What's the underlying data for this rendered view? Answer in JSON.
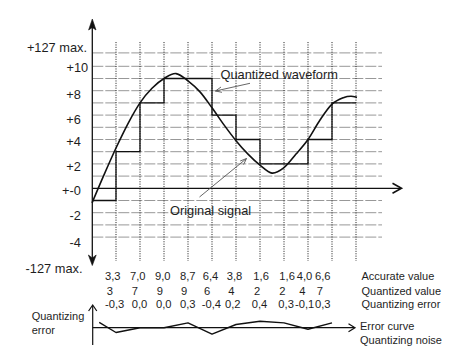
{
  "chart_data": {
    "type": "line",
    "title": "",
    "subtitle": "",
    "xlabel": "",
    "ylabel": "",
    "legend": "none (inline annotations)",
    "ylim": [
      -6.5,
      13.9
    ],
    "grid": {
      "horizontal": true,
      "horizontal_lines": [
        11.1,
        10,
        9,
        8,
        7,
        6,
        5,
        4,
        3,
        2,
        1,
        0,
        -1,
        -2,
        -3,
        -4
      ],
      "vertical_dotted_lines_at_samples": [
        1,
        2,
        3,
        4,
        5,
        6,
        7,
        8,
        9,
        10,
        11
      ]
    },
    "y_ticks": [
      {
        "label": "+127 max.",
        "value": 11.1
      },
      {
        "label": "+10",
        "value": 10
      },
      {
        "label": "+8",
        "value": 8
      },
      {
        "label": "+6",
        "value": 6
      },
      {
        "label": "+4",
        "value": 4
      },
      {
        "label": "+2",
        "value": 2
      },
      {
        "label": "+-0",
        "value": 0
      },
      {
        "label": "-2",
        "value": -2
      },
      {
        "label": "-4",
        "value": -4
      },
      {
        "label": "-127 max.",
        "value": -6.5
      }
    ],
    "x": [
      1,
      2,
      3,
      4,
      5,
      6,
      7,
      8,
      9,
      10
    ],
    "series": [
      {
        "name": "Original signal",
        "style": "smooth",
        "sample_values": [
          3.3,
          7.0,
          9.0,
          8.7,
          6.4,
          3.8,
          1.6,
          1.6,
          4.0,
          6.6
        ],
        "trace": [
          [
            0,
            -1.2
          ],
          [
            0.5,
            1.1
          ],
          [
            1,
            3.3
          ],
          [
            1.5,
            5.3
          ],
          [
            2,
            7.0
          ],
          [
            2.5,
            8.2
          ],
          [
            3,
            9.0
          ],
          [
            3.5,
            9.4
          ],
          [
            4,
            8.8
          ],
          [
            4.5,
            7.9
          ],
          [
            5,
            6.6
          ],
          [
            5.5,
            5.2
          ],
          [
            6,
            3.9
          ],
          [
            6.5,
            2.8
          ],
          [
            7,
            1.9
          ],
          [
            7.5,
            1.25
          ],
          [
            8,
            1.7
          ],
          [
            8.5,
            2.8
          ],
          [
            9,
            4.0
          ],
          [
            9.5,
            5.6
          ],
          [
            10,
            6.9
          ],
          [
            10.5,
            7.45
          ],
          [
            10.8,
            7.55
          ],
          [
            11.04,
            7.45
          ]
        ]
      },
      {
        "name": "Quantized waveform",
        "style": "step",
        "initial_value": -1,
        "values": [
          3,
          7,
          9,
          9,
          6,
          4,
          2,
          2,
          4,
          7
        ],
        "end_sample": 11
      }
    ],
    "annotations": [
      {
        "text": "Quantized waveform",
        "points_to": "Quantized waveform"
      },
      {
        "text": "Original signal",
        "points_to": "Original signal"
      }
    ],
    "table": {
      "rows": [
        {
          "label": "Accurate value",
          "values": [
            "3,3",
            "7,0",
            "9,0",
            "8,7",
            "6,4",
            "3,8",
            "1,6",
            "1,6",
            "4,0",
            "6,6"
          ]
        },
        {
          "label": "Quantized value",
          "values": [
            "3",
            "7",
            "9",
            "9",
            "6",
            "4",
            "2",
            "2",
            "4",
            "7"
          ]
        },
        {
          "label": "Quantizing error",
          "values": [
            "-0,3",
            "0,0",
            "0,0",
            "0,3",
            "-0,4",
            "0,2",
            "0,4",
            "0,3",
            "-0,1",
            "0,3"
          ]
        }
      ]
    },
    "error_plot": {
      "type": "line",
      "y_label_line1": "Quantizing",
      "y_label_line2": "error",
      "curve_label": "Error curve",
      "noise_label": "Quantizing noise",
      "initial_point": [
        0.3,
        0.34
      ],
      "values": [
        -0.3,
        0.0,
        0.0,
        0.3,
        -0.4,
        0.2,
        0.4,
        0.3,
        -0.1,
        0.3
      ]
    }
  }
}
